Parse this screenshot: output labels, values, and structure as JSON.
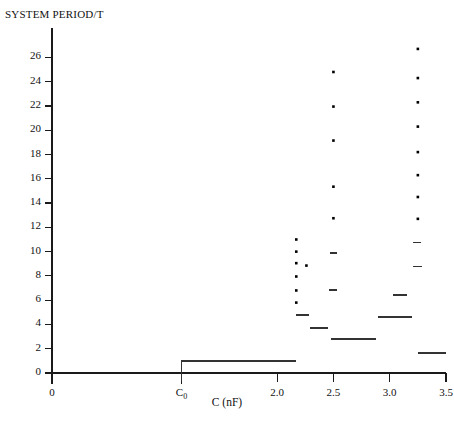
{
  "chart_data": {
    "type": "scatter",
    "title": "",
    "ylabel": "SYSTEM PERIOD/T",
    "xlabel": "C (nF)",
    "xlim": [
      0,
      3.5
    ],
    "ylim": [
      0,
      27.6
    ],
    "grid": false,
    "legend": "none",
    "xticks": [
      {
        "value": 0,
        "label": "0"
      },
      {
        "value": 1.15,
        "label": "C₀"
      },
      {
        "value": 2.0,
        "label": "2.0"
      },
      {
        "value": 2.5,
        "label": "2.5"
      },
      {
        "value": 3.0,
        "label": "3.0"
      },
      {
        "value": 3.5,
        "label": "3.5"
      }
    ],
    "yticks": [
      {
        "value": 0,
        "label": "0"
      },
      {
        "value": 2,
        "label": "2"
      },
      {
        "value": 4,
        "label": "4"
      },
      {
        "value": 6,
        "label": "6"
      },
      {
        "value": 8,
        "label": "8"
      },
      {
        "value": 10,
        "label": "10"
      },
      {
        "value": 12,
        "label": "12"
      },
      {
        "value": 14,
        "label": "14"
      },
      {
        "value": 16,
        "label": "16"
      },
      {
        "value": 18,
        "label": "18"
      },
      {
        "value": 20,
        "label": "20"
      },
      {
        "value": 22,
        "label": "22"
      },
      {
        "value": 24,
        "label": "24"
      },
      {
        "value": 26,
        "label": "26"
      }
    ],
    "series": [
      {
        "name": "stable period windows",
        "type": "segments",
        "segments": [
          {
            "x0": 1.15,
            "x1": 2.17,
            "y": 1.0
          },
          {
            "x0": 2.17,
            "x1": 2.28,
            "y": 4.75
          },
          {
            "x0": 2.29,
            "x1": 2.45,
            "y": 3.68
          },
          {
            "x0": 2.46,
            "x1": 2.53,
            "y": 6.82
          },
          {
            "x0": 2.48,
            "x1": 2.88,
            "y": 2.78
          },
          {
            "x0": 2.9,
            "x1": 3.2,
            "y": 4.6
          },
          {
            "x0": 3.03,
            "x1": 3.15,
            "y": 6.45
          },
          {
            "x0": 3.21,
            "x1": 3.28,
            "y": 10.75
          },
          {
            "x0": 3.21,
            "x1": 3.29,
            "y": 8.78
          },
          {
            "x0": 2.47,
            "x1": 2.53,
            "y": 9.88
          },
          {
            "x0": 3.25,
            "x1": 3.5,
            "y": 1.62
          }
        ]
      },
      {
        "name": "period points",
        "type": "points",
        "points": [
          {
            "x": 2.17,
            "y": 11.0
          },
          {
            "x": 2.17,
            "y": 10.0
          },
          {
            "x": 2.17,
            "y": 9.05
          },
          {
            "x": 2.17,
            "y": 7.95
          },
          {
            "x": 2.17,
            "y": 6.8
          },
          {
            "x": 2.17,
            "y": 5.8
          },
          {
            "x": 2.26,
            "y": 8.85
          },
          {
            "x": 2.5,
            "y": 24.8
          },
          {
            "x": 2.5,
            "y": 21.95
          },
          {
            "x": 2.5,
            "y": 19.15
          },
          {
            "x": 2.5,
            "y": 15.35
          },
          {
            "x": 2.5,
            "y": 12.75
          },
          {
            "x": 3.25,
            "y": 26.7
          },
          {
            "x": 3.25,
            "y": 24.3
          },
          {
            "x": 3.25,
            "y": 22.3
          },
          {
            "x": 3.25,
            "y": 20.3
          },
          {
            "x": 3.25,
            "y": 18.2
          },
          {
            "x": 3.25,
            "y": 16.3
          },
          {
            "x": 3.25,
            "y": 14.5
          },
          {
            "x": 3.25,
            "y": 12.7
          }
        ]
      }
    ],
    "colors": {
      "axis": "#1a1a1a",
      "marker": "#000000",
      "segment": "#333333",
      "background": "#ffffff"
    }
  },
  "caption": ""
}
